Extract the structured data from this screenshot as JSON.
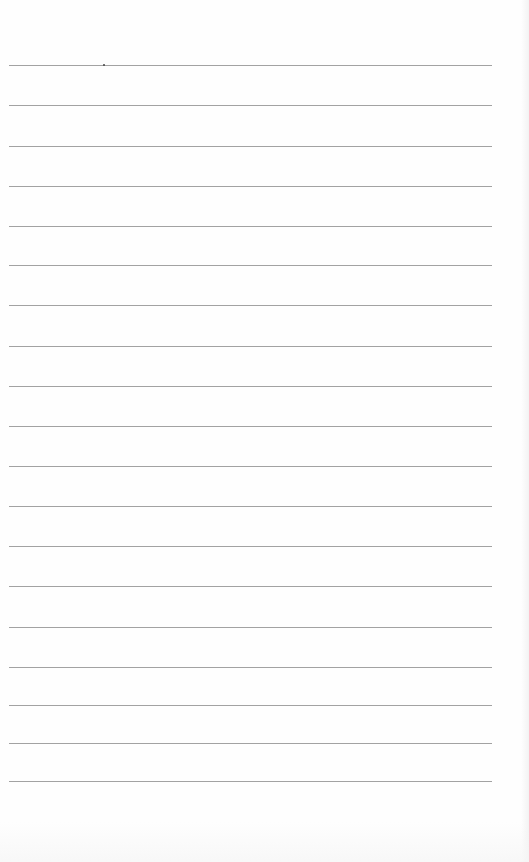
{
  "page": {
    "type": "blank ruled notebook page",
    "background_color": "#ffffff",
    "rule_color": "#a2a2a2",
    "rule_left": 9,
    "rule_right": 492,
    "rules_y": [
      65,
      105,
      146,
      186,
      226,
      265,
      305,
      346,
      386,
      426,
      466,
      506,
      546,
      586,
      627,
      667,
      705,
      743,
      781
    ],
    "rule_count": 19,
    "text_content": ""
  },
  "marks": [
    {
      "name": "ink-speck",
      "x": 103,
      "y": 64
    }
  ]
}
